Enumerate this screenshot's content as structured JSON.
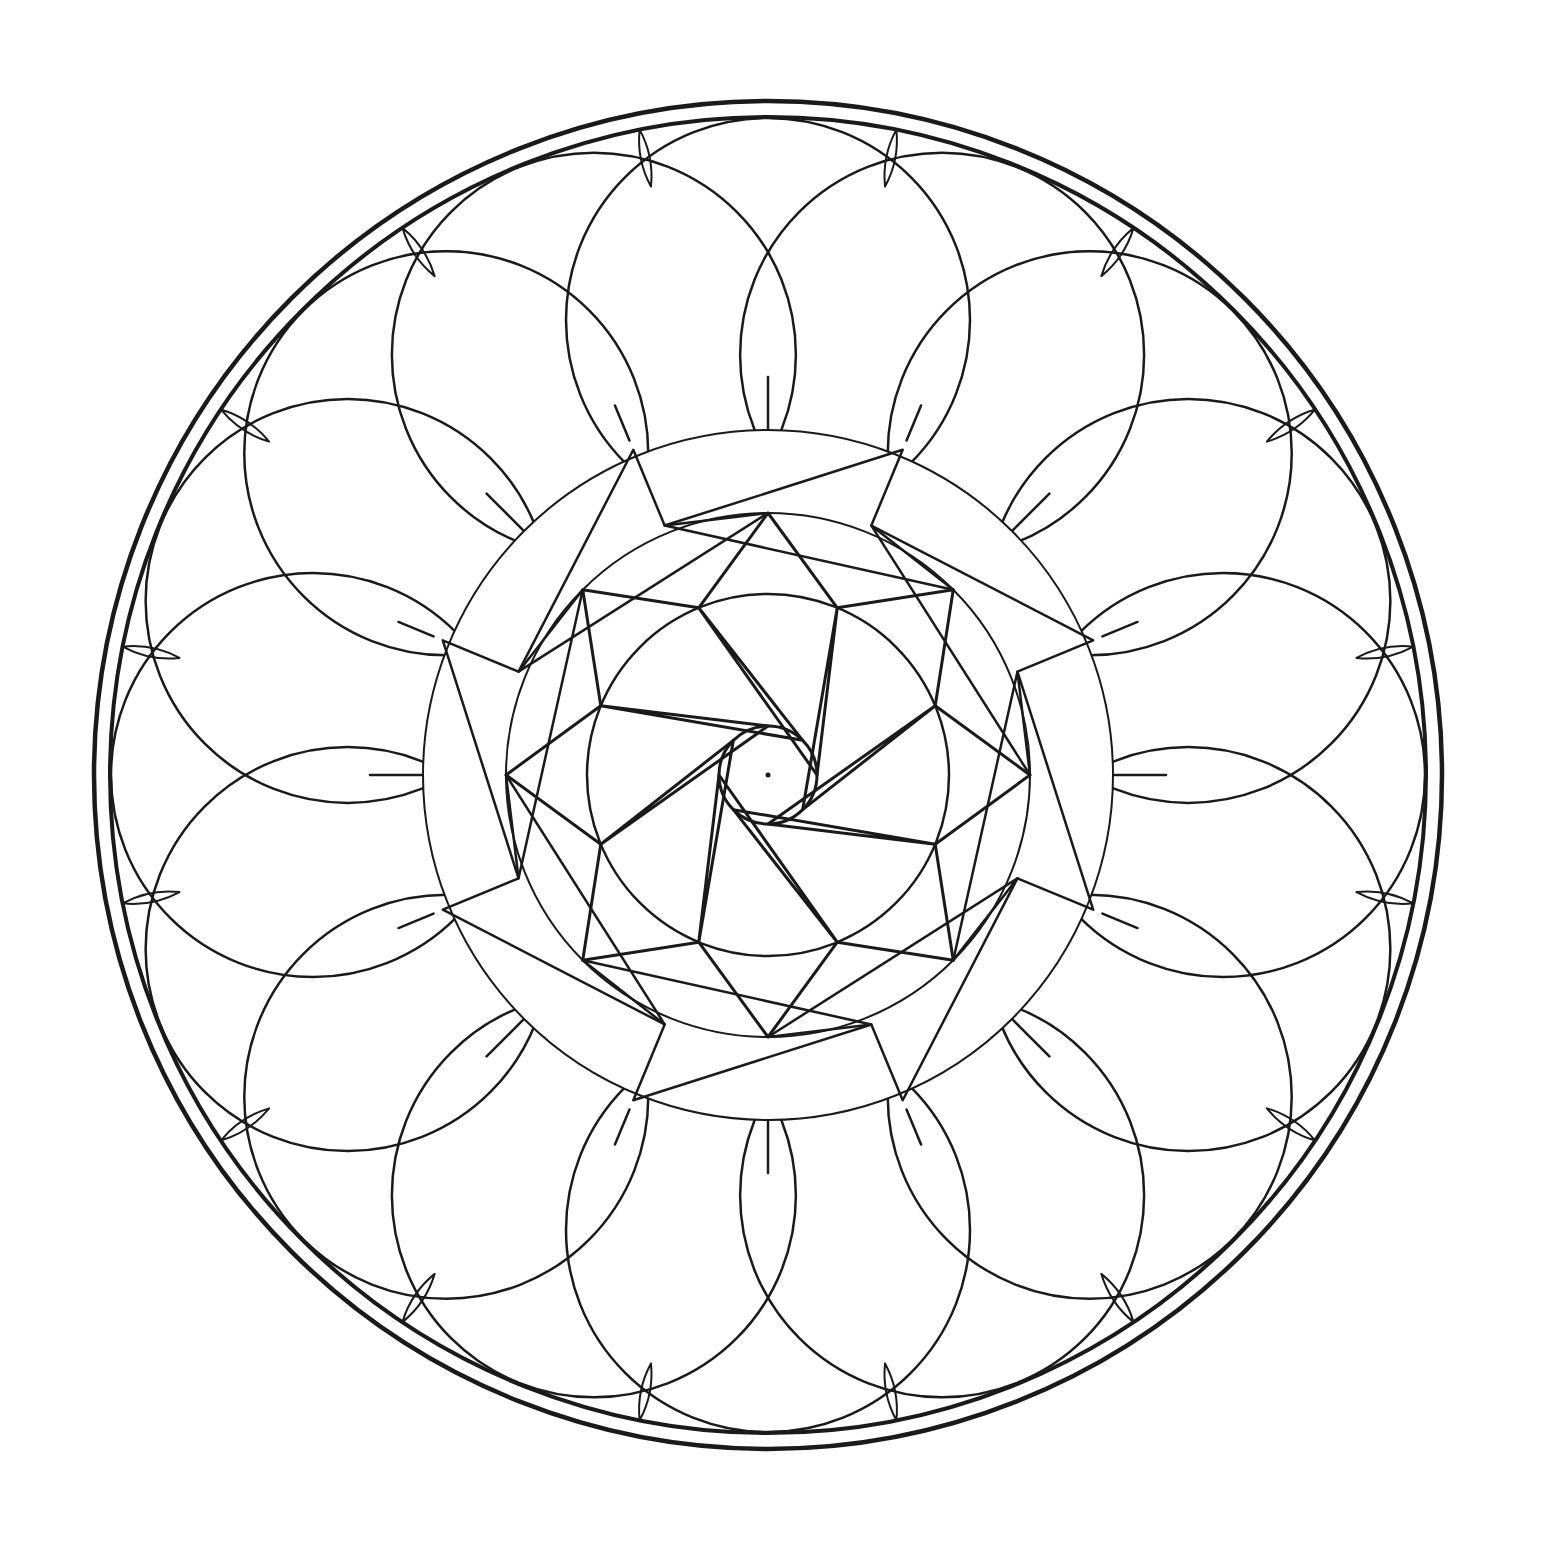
{
  "image": {
    "kind": "mandala-line-art",
    "background": "#ffffff",
    "stroke_color": "#1a1a1a",
    "width": 1542,
    "height": 1543
  },
  "geometry": {
    "center": [
      768,
      775
    ],
    "outer_rings": [
      {
        "r": 674,
        "stroke_width": 4.5
      },
      {
        "r": 658,
        "stroke_width": 4
      }
    ],
    "hub_circle": {
      "r": 49,
      "stroke_width": 3
    },
    "hub_dot": {
      "r": 2.5
    },
    "inner_circle": {
      "r": 181,
      "stroke_width": 2.5
    },
    "middle_circle": {
      "r": 262,
      "stroke_width": 2
    },
    "third_circle": {
      "r": 345,
      "stroke_width": 2
    },
    "star8": {
      "outer_r": 181,
      "outer_offset_deg": -112.5,
      "inner_r": 49,
      "inner_offset_deg": -90,
      "points": 8,
      "stroke_width": 3
    },
    "octagram": {
      "outer_r": 262,
      "outer_offset_deg": -90,
      "inner_r": 181,
      "inner_offset_deg": -112.5,
      "points": 8,
      "stroke_width": 3
    },
    "outer_octagram": {
      "outer_r": 270,
      "outer_offset_deg": -112.5,
      "mid_r": 262,
      "mid_offset_deg": -90,
      "points": 8,
      "stroke_width": 2.5
    },
    "ring3_polygon": {
      "outer_r": 352,
      "outer_offset_deg": -67.5,
      "inner_r": 270,
      "inner_offset_deg": -112.5,
      "points": 8,
      "stroke_width": 2.5
    },
    "spokes_inner": {
      "from_r": 345,
      "to_r": 398,
      "offset_deg": -90,
      "count": 8,
      "stroke_width": 2.5
    },
    "spokes_diag": {
      "from_r": 362,
      "to_r": 400,
      "offset_deg": -67.5,
      "count": 8,
      "stroke_width": 2.5
    },
    "petal_circles": {
      "center_r": 455,
      "offset_deg": -90,
      "radius": 202,
      "count": 16,
      "step_deg": 22.5,
      "stroke_width": 2.5
    },
    "lens_marks": {
      "r_from": 600,
      "r_to": 658,
      "offset_deg": -90,
      "count": 16,
      "step_deg": 22.5,
      "half_width": 9,
      "stroke_width": 2
    }
  }
}
